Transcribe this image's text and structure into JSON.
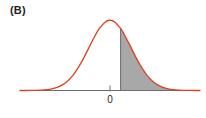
{
  "figure": {
    "panel_label": "(B)",
    "background_color": "#ffffff"
  },
  "chart_data": {
    "type": "area",
    "title": "(B)",
    "xlabel": "",
    "ylabel": "",
    "grid": false,
    "legend": null,
    "axis": {
      "x_axis_visible": true,
      "y_axis_visible": false,
      "x_tick_values": [
        0
      ],
      "x_tick_labels": [
        "0"
      ],
      "xlim": [
        -4.25,
        4.25
      ],
      "ylim": [
        0,
        0.44
      ]
    },
    "curve": {
      "name": "standard-normal-density",
      "distribution": "normal",
      "mean": 0,
      "sd": 1,
      "color": "#e0401e",
      "line_width": 1.3,
      "x": [
        -4.25,
        -4,
        -3.75,
        -3.5,
        -3.25,
        -3,
        -2.75,
        -2.5,
        -2.25,
        -2,
        -1.75,
        -1.5,
        -1.25,
        -1,
        -0.75,
        -0.5,
        -0.25,
        0,
        0.25,
        0.5,
        0.75,
        1,
        1.25,
        1.5,
        1.75,
        2,
        2.25,
        2.5,
        2.75,
        3,
        3.25,
        3.5,
        3.75,
        4,
        4.25
      ],
      "y": [
        0.0001,
        0.0001,
        0.0004,
        0.0009,
        0.002,
        0.0044,
        0.0091,
        0.0175,
        0.0317,
        0.054,
        0.0863,
        0.1295,
        0.1826,
        0.242,
        0.3011,
        0.3521,
        0.3867,
        0.3989,
        0.3867,
        0.3521,
        0.3011,
        0.242,
        0.1826,
        0.1295,
        0.0863,
        0.054,
        0.0317,
        0.0175,
        0.0091,
        0.0044,
        0.002,
        0.0009,
        0.0004,
        0.0001,
        0.0001
      ]
    },
    "shaded_region": {
      "name": "upper-tail-shaded-area",
      "fill_color": "#a8a8a8",
      "boundary_line_color": "#6e6e6e",
      "x_from": 0.5,
      "x_to": 4.25,
      "side": "right"
    },
    "annotations": [
      {
        "text": "(B)",
        "position": "top-left"
      },
      {
        "text": "0",
        "x": 0,
        "position": "below-axis"
      }
    ]
  },
  "colors": {
    "curve": "#e0401e",
    "shade_fill": "#a8a8a8",
    "axis": "#6e6e6e",
    "text": "#231f20"
  }
}
